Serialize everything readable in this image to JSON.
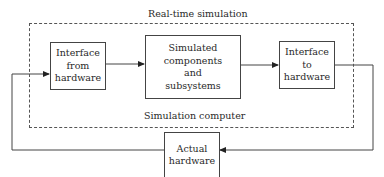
{
  "diagram": {
    "container": {
      "top_label": "Real-time simulation",
      "bottom_label": "Simulation computer"
    },
    "nodes": [
      {
        "id": "iface-from",
        "lines": [
          "Interface",
          "from",
          "hardware"
        ]
      },
      {
        "id": "simulated",
        "lines": [
          "Simulated",
          "components",
          "and",
          "subsystems"
        ]
      },
      {
        "id": "iface-to",
        "lines": [
          "Interface",
          "to",
          "hardware"
        ]
      },
      {
        "id": "actual",
        "lines": [
          "Actual",
          "hardware"
        ]
      }
    ],
    "edges": [
      {
        "from": "actual",
        "to": "iface-from"
      },
      {
        "from": "iface-from",
        "to": "simulated"
      },
      {
        "from": "simulated",
        "to": "iface-to"
      },
      {
        "from": "iface-to",
        "to": "actual"
      }
    ],
    "colors": {
      "line": "#444444",
      "text": "#2a2a2a",
      "background": "#ffffff"
    }
  }
}
